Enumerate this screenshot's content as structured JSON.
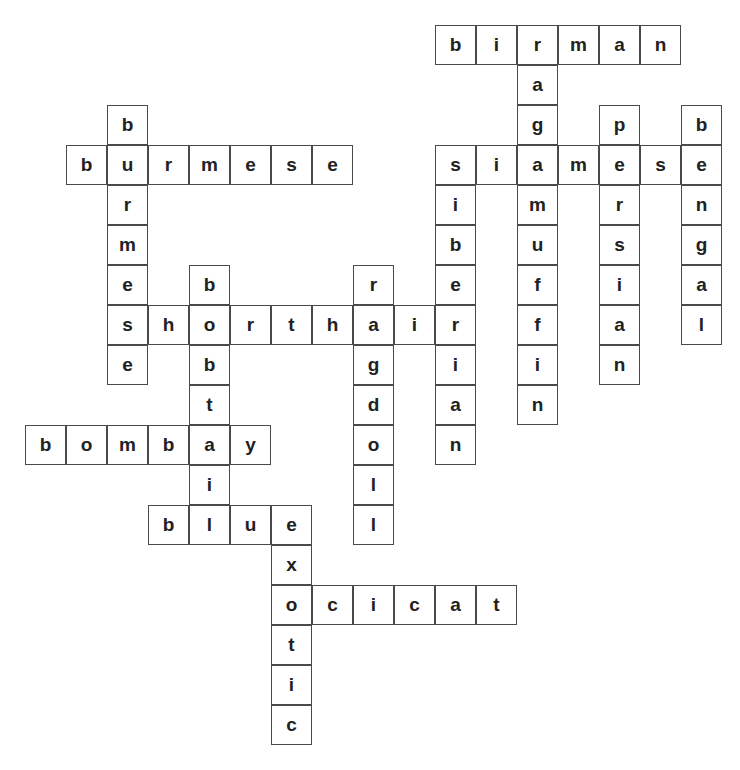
{
  "puzzle": {
    "type": "crossword",
    "origin": {
      "x": 25,
      "y": 25
    },
    "cell": {
      "w": 41,
      "h": 40
    },
    "colors": {
      "border": "#4a4a4a",
      "letter": "#222222",
      "background": "#ffffff"
    },
    "words": [
      {
        "word": "birman",
        "dir": "across",
        "row": 0,
        "col": 10
      },
      {
        "word": "ragamuffin",
        "dir": "down",
        "row": 0,
        "col": 12
      },
      {
        "word": "persian",
        "dir": "down",
        "row": 2,
        "col": 14
      },
      {
        "word": "bengal",
        "dir": "down",
        "row": 2,
        "col": 16
      },
      {
        "word": "burmese",
        "dir": "down",
        "row": 2,
        "col": 2
      },
      {
        "word": "burmese",
        "dir": "across",
        "row": 3,
        "col": 1
      },
      {
        "word": "siamese",
        "dir": "across",
        "row": 3,
        "col": 10
      },
      {
        "word": "siberian",
        "dir": "down",
        "row": 3,
        "col": 10
      },
      {
        "word": "bobtail",
        "dir": "down",
        "row": 6,
        "col": 4
      },
      {
        "word": "ragdoll",
        "dir": "down",
        "row": 6,
        "col": 8
      },
      {
        "word": "shorthair",
        "dir": "across",
        "row": 7,
        "col": 2
      },
      {
        "word": "bombay",
        "dir": "across",
        "row": 10,
        "col": 0
      },
      {
        "word": "blue",
        "dir": "across",
        "row": 12,
        "col": 3
      },
      {
        "word": "exotic",
        "dir": "down",
        "row": 12,
        "col": 6
      },
      {
        "word": "ocicat",
        "dir": "across",
        "row": 14,
        "col": 6
      }
    ]
  }
}
